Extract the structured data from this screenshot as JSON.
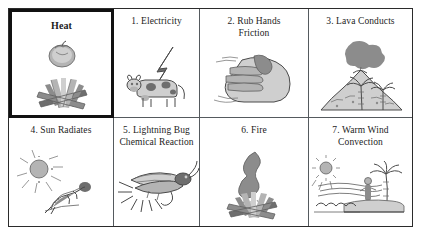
{
  "figure": {
    "rows": 2,
    "columns": 4,
    "highlight_color": "#111111",
    "border_color": "#555a5e"
  },
  "cells": [
    {
      "label": "Heat",
      "icon": "tomato-and-campfire-icon",
      "highlighted": true
    },
    {
      "label": "1. Electricity",
      "icon": "cow-and-lightning-bolt-icon",
      "highlighted": false
    },
    {
      "label": "2. Rub Hands\nFriction",
      "icon": "rubbing-hands-icon",
      "highlighted": false
    },
    {
      "label": "3. Lava Conducts",
      "icon": "erupting-volcano-icon",
      "highlighted": false
    },
    {
      "label": "4. Sun Radiates",
      "icon": "sun-and-sunbather-icon",
      "highlighted": false
    },
    {
      "label": "5. Lightning Bug\nChemical Reaction",
      "icon": "firefly-icon",
      "highlighted": false
    },
    {
      "label": "6. Fire",
      "icon": "flame-and-logs-icon",
      "highlighted": false
    },
    {
      "label": "7. Warm Wind\nConvection",
      "icon": "beach-wind-convection-icon",
      "highlighted": false
    }
  ]
}
